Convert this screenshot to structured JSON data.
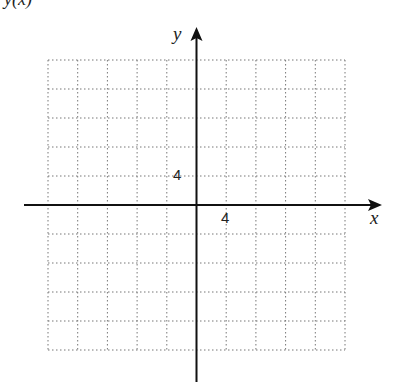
{
  "title": "y(x)",
  "chart_data": {
    "type": "grid",
    "x_axis_label": "x",
    "y_axis_label": "y",
    "x_tick_label": "4",
    "y_tick_label": "4",
    "grid": {
      "columns": 10,
      "rows": 10,
      "style": "dotted"
    },
    "units_per_cell": 4,
    "x_range": [
      -20,
      20
    ],
    "y_range": [
      -20,
      20
    ]
  }
}
